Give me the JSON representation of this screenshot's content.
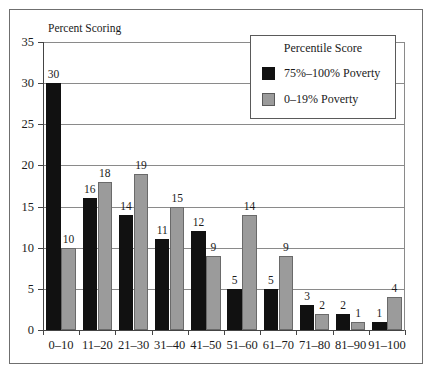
{
  "chart_data": {
    "type": "bar",
    "title": "",
    "ylabel": "Percent Scoring",
    "xlabel": "",
    "ylim": [
      0,
      35
    ],
    "yticks": [
      0,
      5,
      10,
      15,
      20,
      25,
      30,
      35
    ],
    "grid": true,
    "legend_position": "top-right",
    "legend_title": "Percentile Score",
    "categories": [
      "0–10",
      "11–20",
      "21–30",
      "31–40",
      "41–50",
      "51–60",
      "61–70",
      "71–80",
      "81–90",
      "91–100"
    ],
    "series": [
      {
        "name": "75%–100% Poverty",
        "color": "#111111",
        "values": [
          30,
          16,
          14,
          11,
          12,
          5,
          5,
          3,
          2,
          1
        ]
      },
      {
        "name": "0–19% Poverty",
        "color": "#9b9b9b",
        "values": [
          10,
          18,
          19,
          15,
          9,
          14,
          9,
          2,
          1,
          4
        ]
      }
    ]
  }
}
